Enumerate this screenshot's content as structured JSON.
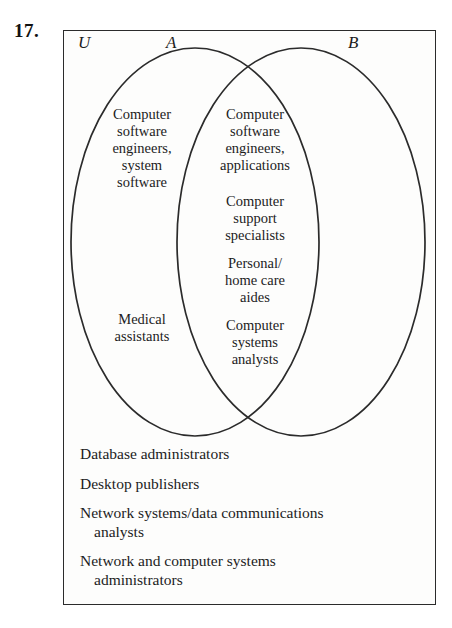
{
  "problem": {
    "number": "17."
  },
  "diagram": {
    "type": "venn-two-set",
    "universe_label": "U",
    "set_a_label": "A",
    "set_b_label": "B",
    "regions": {
      "a_only": [
        {
          "id": "a-only-1",
          "lines": [
            "Computer",
            "software",
            "engineers,",
            "system",
            "software"
          ]
        },
        {
          "id": "a-only-2",
          "lines": [
            "Medical",
            "assistants"
          ]
        }
      ],
      "a_and_b": [
        {
          "id": "ab-1",
          "lines": [
            "Computer",
            "software",
            "engineers,",
            "applications"
          ]
        },
        {
          "id": "ab-2",
          "lines": [
            "Computer",
            "support",
            "specialists"
          ]
        },
        {
          "id": "ab-3",
          "lines": [
            "Personal/",
            "home care",
            "aides"
          ]
        },
        {
          "id": "ab-4",
          "lines": [
            "Computer",
            "systems",
            "analysts"
          ]
        }
      ],
      "b_only": [],
      "outside": [
        {
          "line1": "Database administrators",
          "line2": ""
        },
        {
          "line1": "Desktop publishers",
          "line2": ""
        },
        {
          "line1": "Network systems/data communications",
          "line2": "analysts"
        },
        {
          "line1": "Network and computer systems",
          "line2": "administrators"
        }
      ]
    }
  },
  "colors": {
    "ink": "#1c1c1c",
    "rule": "#2b2b2b",
    "paper": "#fdfdfc"
  }
}
